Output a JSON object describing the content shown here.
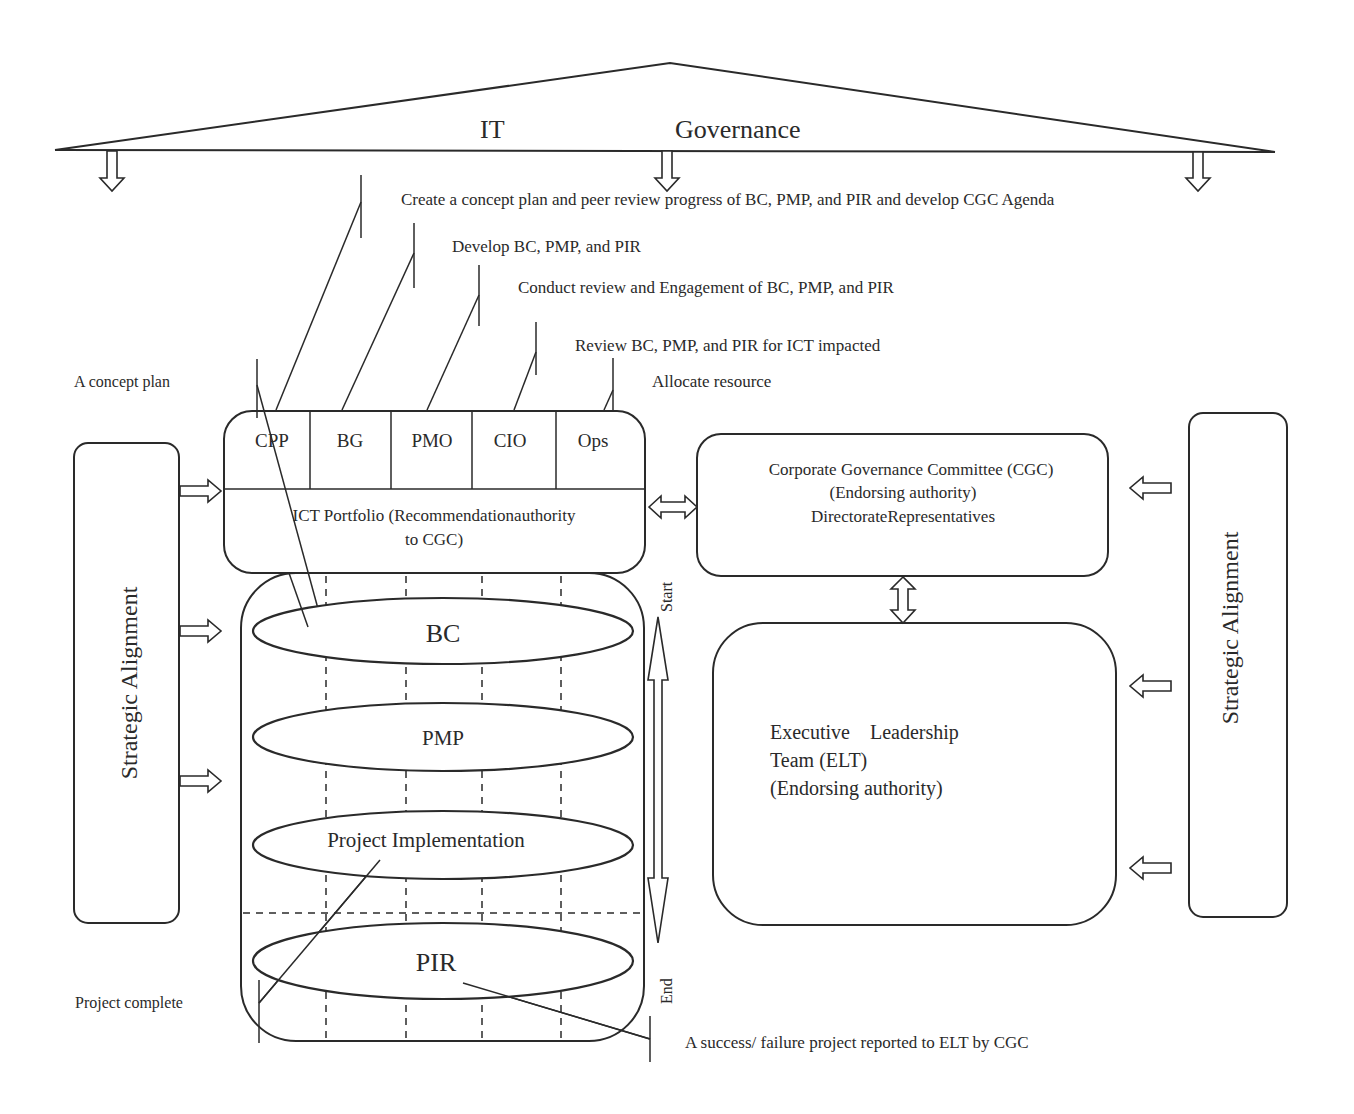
{
  "governance": {
    "title_left": "IT",
    "title_right": "Governance"
  },
  "callouts": {
    "create_concept": "Create a concept plan and peer review progress of BC, PMP, and PIR and develop CGC Agenda",
    "develop": "Develop BC, PMP, and PIR",
    "conduct_review": "Conduct review and Engagement of BC, PMP, and PIR",
    "review_ict": "Review BC, PMP, and PIR for ICT impacted",
    "allocate": "Allocate resource",
    "concept_plan": "A concept plan",
    "project_complete": "Project complete",
    "success_failure": "A success/ failure project reported to ELT by CGC"
  },
  "portfolio": {
    "roles": [
      "CPP",
      "BG",
      "PMO",
      "CIO",
      "Ops"
    ],
    "line1": "ICT Portfolio (Recommendationauthority",
    "line2": "to CGC)"
  },
  "lifecycle": {
    "stages": [
      "BC",
      "PMP",
      "Project Implementation",
      "PIR"
    ],
    "start_label": "Start",
    "end_label": "End"
  },
  "cgc": {
    "line1": "Corporate Governance Committee (CGC)",
    "line2": "(Endorsing authority)",
    "line3": "DirectorateRepresentatives"
  },
  "elt": {
    "line1": "Executive    Leadership",
    "line2": "Team (ELT)",
    "line3": "(Endorsing authority)"
  },
  "strategic_alignment": {
    "left_label": "Strategic Alignment",
    "right_label": "Strategic Alignment"
  },
  "colors": {
    "stroke": "#2a2a2a",
    "background": "#ffffff"
  }
}
